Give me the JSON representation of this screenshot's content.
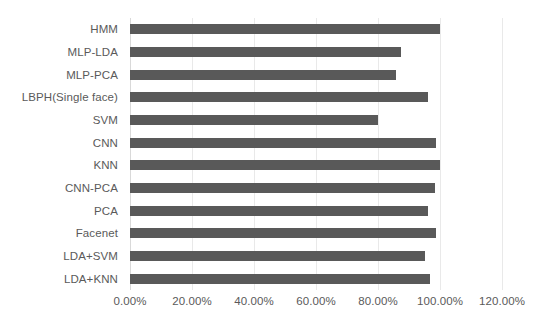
{
  "chart_data": {
    "type": "bar",
    "orientation": "horizontal",
    "title": "",
    "subtitle": "",
    "xlabel": "",
    "ylabel": "",
    "categories": [
      "HMM",
      "MLP-LDA",
      "MLP-PCA",
      "LBPH(Single face)",
      "SVM",
      "CNN",
      "KNN",
      "CNN-PCA",
      "PCA",
      "Facenet",
      "LDA+SVM",
      "LDA+KNN"
    ],
    "values": [
      100.0,
      87.4,
      85.8,
      96.0,
      80.0,
      98.7,
      100.0,
      98.4,
      96.0,
      98.7,
      95.0,
      96.8
    ],
    "value_unit": "percent",
    "xlim": [
      0,
      120
    ],
    "xticks": [
      0,
      20,
      40,
      60,
      80,
      100,
      120
    ],
    "xticklabels": [
      "0.00%",
      "20.00%",
      "40.00%",
      "60.00%",
      "80.00%",
      "100.00%",
      "120.00%"
    ],
    "grid": true,
    "grid_axis": "x",
    "legend": false,
    "legend_position": "none",
    "series": [
      {
        "name": "Accuracy",
        "color": "#595959",
        "values": [
          100.0,
          87.4,
          85.8,
          96.0,
          80.0,
          98.7,
          100.0,
          98.4,
          96.0,
          98.7,
          95.0,
          96.8
        ]
      }
    ]
  },
  "colors": {
    "bar": "#595959",
    "gridline": "#e9e9e9",
    "axis_line": "#d9d9d9",
    "label_text": "#5a5a5a",
    "background": "#ffffff"
  }
}
